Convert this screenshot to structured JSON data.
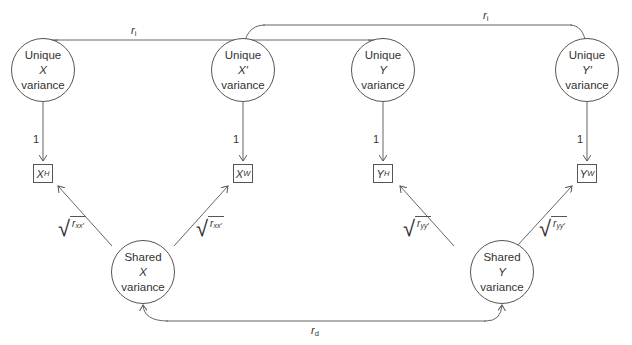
{
  "diagram": {
    "unique_nodes": [
      {
        "id": "unique-x",
        "line1": "Unique",
        "var": "X",
        "line3": "variance"
      },
      {
        "id": "unique-xprime",
        "line1": "Unique",
        "var": "X′",
        "line3": "variance"
      },
      {
        "id": "unique-y",
        "line1": "Unique",
        "var": "Y",
        "line3": "variance"
      },
      {
        "id": "unique-yprime",
        "line1": "Unique",
        "var": "Y′",
        "line3": "variance"
      }
    ],
    "shared_nodes": [
      {
        "id": "shared-x",
        "line1": "Shared",
        "var": "X",
        "line3": "variance"
      },
      {
        "id": "shared-y",
        "line1": "Shared",
        "var": "Y",
        "line3": "variance"
      }
    ],
    "observed": [
      {
        "id": "x-h",
        "base": "X",
        "sub": "H"
      },
      {
        "id": "x-w",
        "base": "X",
        "sub": "W"
      },
      {
        "id": "y-h",
        "base": "Y",
        "sub": "H"
      },
      {
        "id": "y-w",
        "base": "Y",
        "sub": "W"
      }
    ],
    "loadings": {
      "unique": "1"
    },
    "sqrt_labels": [
      {
        "base": "r",
        "sub": "xx′"
      },
      {
        "base": "r",
        "sub": "xx′"
      },
      {
        "base": "r",
        "sub": "yy′"
      },
      {
        "base": "r",
        "sub": "yy′"
      }
    ],
    "correlations": {
      "ri_base": "r",
      "ri_sub": "i",
      "rd_base": "r",
      "rd_sub": "d"
    }
  }
}
